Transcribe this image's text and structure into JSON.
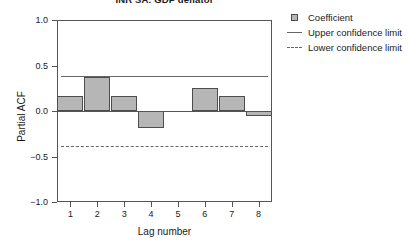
{
  "chart_data": {
    "type": "bar",
    "title": "INR SA: GDP deflator",
    "xlabel": "Lag number",
    "ylabel": "Partial ACF",
    "categories": [
      "1",
      "2",
      "3",
      "4",
      "5",
      "6",
      "7",
      "8"
    ],
    "values": [
      0.16,
      0.37,
      0.16,
      -0.19,
      0.0,
      0.25,
      0.16,
      -0.06
    ],
    "series": [
      {
        "name": "Coefficient",
        "values": [
          0.16,
          0.37,
          0.16,
          -0.19,
          0.0,
          0.25,
          0.16,
          -0.06
        ]
      }
    ],
    "ylim": [
      -1.0,
      1.0
    ],
    "yticks": [
      1.0,
      0.5,
      0.0,
      -0.5,
      -1.0
    ],
    "ytick_labels": [
      "1.0",
      "0.5",
      "0.0",
      "-0.5",
      "-1.0"
    ],
    "xticks": [
      1,
      2,
      3,
      4,
      5,
      6,
      7,
      8
    ],
    "xtick_labels": [
      "1",
      "2",
      "3",
      "4",
      "5",
      "6",
      "7",
      "8"
    ],
    "reference_lines": [
      {
        "name": "upper-confidence-limit",
        "value": 0.38,
        "style": "solid"
      },
      {
        "name": "lower-confidence-limit",
        "value": -0.38,
        "style": "dashed"
      },
      {
        "name": "zero-line",
        "value": 0.0,
        "style": "solid"
      }
    ],
    "grid": false,
    "legend_position": "right",
    "colors": {
      "bar_fill": "#b6b6b6",
      "bar_border": "#4d4d4d",
      "axis": "#555555",
      "confidence": "#666666",
      "text": "#1a1a1a",
      "background": "#ffffff"
    }
  },
  "legend": {
    "items": [
      {
        "label": "Coefficient",
        "key": "swatch"
      },
      {
        "label": "Upper confidence limit",
        "key": "solid-line"
      },
      {
        "label": "Lower confidence limit",
        "key": "dashed-line"
      }
    ]
  }
}
